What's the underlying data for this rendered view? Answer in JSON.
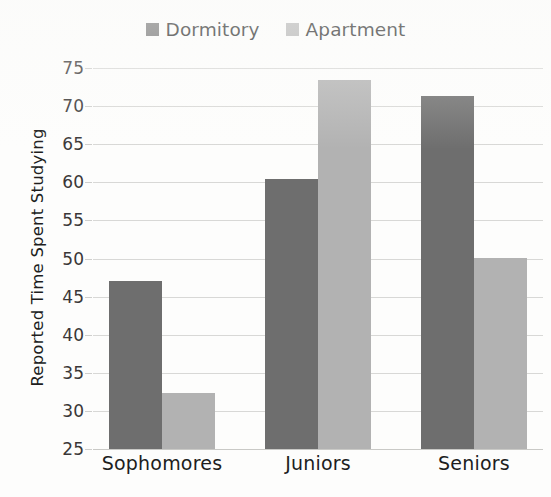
{
  "chart_data": {
    "type": "bar",
    "title": "",
    "xlabel": "",
    "ylabel": "Reported Time Spent Studying",
    "categories": [
      "Sophomores",
      "Juniors",
      "Seniors"
    ],
    "series": [
      {
        "name": "Dormitory",
        "color": "#6e6e6e",
        "values": [
          47,
          60.5,
          71.3
        ]
      },
      {
        "name": "Apartment",
        "color": "#b2b2b2",
        "values": [
          32.3,
          73.4,
          50.1
        ]
      }
    ],
    "ylim": [
      25,
      75
    ],
    "ytick_step": 5,
    "yticks": [
      25,
      30,
      35,
      40,
      45,
      50,
      55,
      60,
      65,
      70,
      75
    ],
    "ytick_labels": [
      "25",
      "30",
      "35",
      "40",
      "45",
      "50",
      "55",
      "60",
      "65",
      "70",
      "75"
    ],
    "grid": true,
    "legend_position": "top-center"
  }
}
